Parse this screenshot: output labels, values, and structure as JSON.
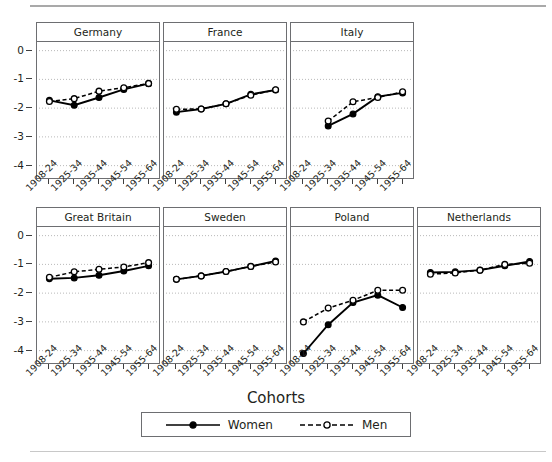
{
  "chart_data": {
    "type": "line",
    "title": "",
    "xlabel": "Cohorts",
    "ylabel": "",
    "categories": [
      "1908-24",
      "1925-34",
      "1935-44",
      "1945-54",
      "1955-64"
    ],
    "ylim": [
      -4.5,
      0.3
    ],
    "yticks": [
      0,
      -1,
      -2,
      -3,
      -4
    ],
    "ytick_labels": [
      "0",
      "-1",
      "-2",
      "-3",
      "-4"
    ],
    "grid": "horizontal-dotted",
    "legend_position": "bottom-center",
    "legend_title": "Cohorts",
    "series_styles": [
      {
        "name": "Women",
        "line": "solid",
        "marker": "filled-circle",
        "color": "#000000"
      },
      {
        "name": "Men",
        "line": "dashed",
        "marker": "open-circle",
        "color": "#000000"
      }
    ],
    "panels": [
      {
        "name": "Germany",
        "row": 1,
        "series": [
          {
            "name": "Women",
            "values": [
              -1.73,
              -1.9,
              -1.63,
              -1.35,
              -1.15
            ]
          },
          {
            "name": "Men",
            "values": [
              -1.77,
              -1.67,
              -1.41,
              -1.29,
              -1.14
            ]
          }
        ]
      },
      {
        "name": "France",
        "row": 1,
        "series": [
          {
            "name": "Women",
            "values": [
              -2.14,
              -2.03,
              -1.85,
              -1.52,
              -1.37
            ]
          },
          {
            "name": "Men",
            "values": [
              -2.04,
              -2.03,
              -1.85,
              -1.55,
              -1.36
            ]
          }
        ]
      },
      {
        "name": "Italy",
        "row": 1,
        "series": [
          {
            "name": "Women",
            "values": [
              null,
              -2.62,
              -2.2,
              -1.6,
              -1.47
            ]
          },
          {
            "name": "Men",
            "values": [
              null,
              -2.45,
              -1.78,
              -1.63,
              -1.43
            ]
          }
        ]
      },
      {
        "name": "Great Britain",
        "row": 2,
        "series": [
          {
            "name": "Women",
            "values": [
              -1.5,
              -1.47,
              -1.38,
              -1.23,
              -1.05
            ]
          },
          {
            "name": "Men",
            "values": [
              -1.45,
              -1.26,
              -1.17,
              -1.09,
              -0.94
            ]
          }
        ]
      },
      {
        "name": "Sweden",
        "row": 2,
        "series": [
          {
            "name": "Women",
            "values": [
              -1.52,
              -1.4,
              -1.25,
              -1.07,
              -0.88
            ]
          },
          {
            "name": "Men",
            "values": [
              -1.52,
              -1.4,
              -1.25,
              -1.07,
              -0.92
            ]
          }
        ]
      },
      {
        "name": "Poland",
        "row": 2,
        "series": [
          {
            "name": "Women",
            "values": [
              -4.1,
              -3.1,
              -2.33,
              -2.07,
              -2.5
            ]
          },
          {
            "name": "Men",
            "values": [
              -3.0,
              -2.52,
              -2.25,
              -1.9,
              -1.9
            ]
          }
        ]
      },
      {
        "name": "Netherlands",
        "row": 2,
        "series": [
          {
            "name": "Women",
            "values": [
              -1.28,
              -1.26,
              -1.2,
              -1.05,
              -0.9
            ]
          },
          {
            "name": "Men",
            "values": [
              -1.34,
              -1.3,
              -1.2,
              -1.0,
              -0.96
            ]
          }
        ]
      }
    ]
  },
  "legend": {
    "title": "Cohorts",
    "entries": [
      {
        "label": "Women"
      },
      {
        "label": "Men"
      }
    ]
  }
}
